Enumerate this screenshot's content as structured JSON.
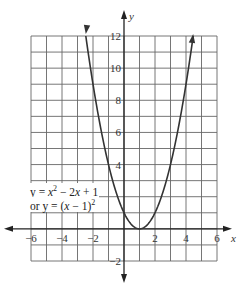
{
  "chart_data": {
    "type": "line",
    "title": "",
    "xlabel": "x",
    "ylabel": "y",
    "xlim": [
      -6,
      6
    ],
    "ylim": [
      -2,
      12
    ],
    "grid": true,
    "x_ticks": [
      -6,
      -4,
      -2,
      2,
      4,
      6
    ],
    "y_ticks": [
      -2,
      4,
      6,
      8,
      10,
      12
    ],
    "series": [
      {
        "name": "y = x^2 - 2x + 1",
        "function": "(x-1)^2",
        "x": [
          -2.46,
          -2,
          -1,
          0,
          1,
          2,
          3,
          4,
          4.46
        ],
        "y": [
          12,
          9,
          4,
          1,
          0,
          1,
          4,
          9,
          12
        ]
      }
    ],
    "annotations": [
      "y = x² − 2x + 1",
      "or y = (x − 1)²"
    ]
  },
  "labels": {
    "x_axis": "x",
    "y_axis": "y",
    "eq_line1": "y = x² − 2x + 1",
    "eq_line2": "or y = (x − 1)²"
  },
  "style": {
    "grid_color": "#555555",
    "curve_color": "#333333"
  }
}
